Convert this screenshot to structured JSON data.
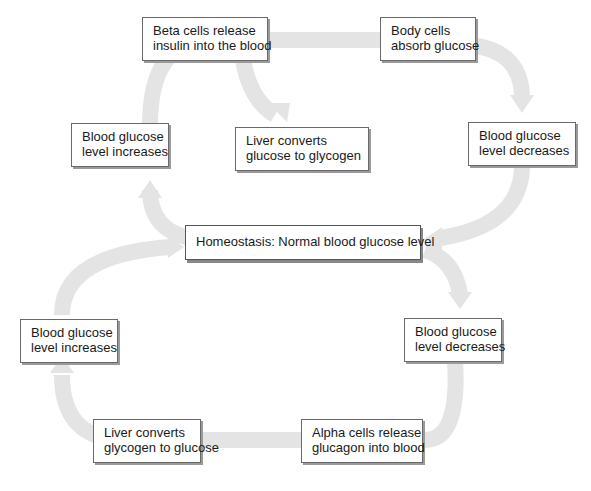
{
  "diagram": {
    "center": {
      "label": "Homeostasis: Normal blood glucose level"
    },
    "top_loop": [
      {
        "id": "beta",
        "line1": "Beta cells release",
        "line2": "insulin into the blood"
      },
      {
        "id": "body",
        "line1": "Body cells",
        "line2": "absorb glucose"
      },
      {
        "id": "liver_glycogen",
        "line1": "Liver converts",
        "line2": "glucose to glycogen"
      },
      {
        "id": "bg_increase_top",
        "line1": "Blood glucose",
        "line2": "level increases"
      },
      {
        "id": "bg_decrease_top",
        "line1": "Blood glucose",
        "line2": "level decreases"
      }
    ],
    "bottom_loop": [
      {
        "id": "bg_increase_bottom",
        "line1": "Blood glucose",
        "line2": "level increases"
      },
      {
        "id": "bg_decrease_bottom",
        "line1": "Blood glucose",
        "line2": "level decreases"
      },
      {
        "id": "liver_glucose",
        "line1": "Liver converts",
        "line2": "glycogen to glucose"
      },
      {
        "id": "alpha",
        "line1": "Alpha cells release",
        "line2": "glucagon into blood"
      }
    ],
    "colors": {
      "arrow": "#e6e6e6",
      "border": "#6a6a6a",
      "shadow": "#9a9a9a"
    }
  }
}
